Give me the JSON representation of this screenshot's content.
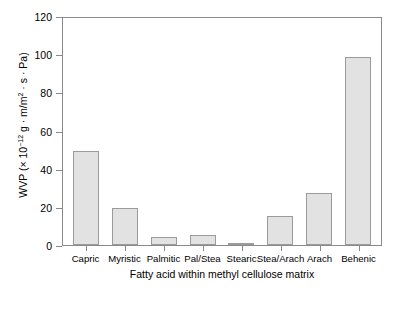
{
  "chart_data": {
    "type": "bar",
    "title": "",
    "categories": [
      "Capric",
      "Myristic",
      "Palmitic",
      "Pal/Stea",
      "Stearic",
      "Stea/Arach",
      "Arach",
      "Behenic"
    ],
    "values": [
      49.5,
      19.3,
      4.4,
      5.0,
      1.3,
      15.1,
      27.3,
      98.5
    ],
    "xlabel": "Fatty acid within methyl cellulose matrix",
    "ylabel_prefix": "WVP (× 10",
    "ylabel_exponent": "−12",
    "ylabel_suffix": " g · m/m",
    "ylabel_exponent2": "2",
    "ylabel_tail": " · s · Pa)",
    "ylabel_full": "WVP (× 10⁻¹² g · m/m² · s · Pa)",
    "ylim": [
      0,
      120
    ],
    "yticks": [
      0,
      20,
      40,
      60,
      80,
      100,
      120
    ],
    "ytick_labels": [
      "0",
      "20",
      "40",
      "60",
      "80",
      "100",
      "120"
    ],
    "grid": false,
    "legend": null,
    "bar_fill_color": "#e2e2e2",
    "bar_edge_color": "#9b9b9b",
    "axis_color": "#8a8a8a",
    "background_color": "#ffffff"
  }
}
